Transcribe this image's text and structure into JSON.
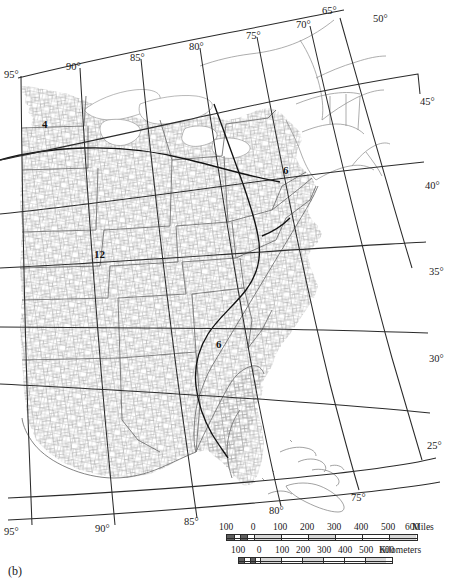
{
  "figure": {
    "caption": "(b)",
    "type": "map",
    "region": "Eastern United States",
    "projection_note": "graticule of meridians and parallels"
  },
  "graticule": {
    "top_longitude_labels": [
      {
        "text": "95°",
        "x": 4,
        "y": 70
      },
      {
        "text": "90°",
        "x": 66,
        "y": 62
      },
      {
        "text": "85°",
        "x": 130,
        "y": 54
      },
      {
        "text": "80°",
        "x": 190,
        "y": 43
      },
      {
        "text": "75°",
        "x": 247,
        "y": 32
      },
      {
        "text": "70°",
        "x": 297,
        "y": 21
      },
      {
        "text": "65°",
        "x": 323,
        "y": 7
      }
    ],
    "bottom_longitude_labels": [
      {
        "text": "95°",
        "x": 4,
        "y": 528
      },
      {
        "text": "90°",
        "x": 96,
        "y": 525
      },
      {
        "text": "85°",
        "x": 185,
        "y": 518
      },
      {
        "text": "80°",
        "x": 270,
        "y": 507
      },
      {
        "text": "75°",
        "x": 352,
        "y": 494
      }
    ],
    "right_latitude_labels": [
      {
        "text": "50°",
        "x": 374,
        "y": 15
      },
      {
        "text": "45°",
        "x": 421,
        "y": 98
      },
      {
        "text": "40°",
        "x": 426,
        "y": 182
      },
      {
        "text": "35°",
        "x": 430,
        "y": 268
      },
      {
        "text": "40°",
        "x": 0,
        "y": 0
      },
      {
        "text": "30°",
        "x": 430,
        "y": 355
      },
      {
        "text": "25°",
        "x": 428,
        "y": 442
      }
    ],
    "meridians": [
      "95°",
      "90°",
      "85°",
      "80°",
      "75°",
      "70°",
      "65°"
    ],
    "parallels": [
      "50°",
      "45°",
      "40°",
      "35°",
      "30°",
      "25°"
    ]
  },
  "contour_labels": [
    {
      "text": "4",
      "x": 42,
      "y": 118
    },
    {
      "text": "12",
      "x": 94,
      "y": 249
    },
    {
      "text": "6",
      "x": 283,
      "y": 165
    },
    {
      "text": "6",
      "x": 216,
      "y": 339
    }
  ],
  "scale_miles": {
    "unit": "Miles",
    "ticks": [
      "100",
      "0",
      "100",
      "200",
      "300",
      "400",
      "500",
      "600"
    ],
    "tick_values": [
      -100,
      0,
      100,
      200,
      300,
      400,
      500,
      600
    ]
  },
  "scale_kilometers": {
    "unit": "Kilometers",
    "ticks": [
      "100",
      "0",
      "100",
      "200",
      "300",
      "400",
      "500",
      "600"
    ],
    "tick_values": [
      -100,
      0,
      100,
      200,
      300,
      400,
      500,
      600
    ]
  },
  "colors": {
    "background": "#ffffff",
    "county_lines": "#9a9a9a",
    "state_coast_lines": "#5a5a5a",
    "graticule": "#2b2b2b",
    "contour": "#111111",
    "text": "#1a1a1a"
  }
}
